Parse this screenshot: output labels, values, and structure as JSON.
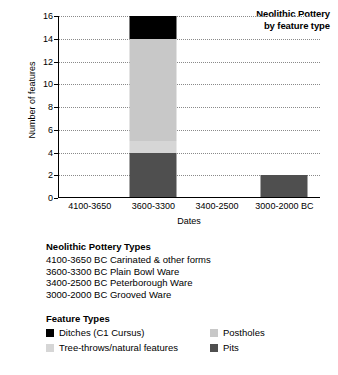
{
  "chart_data": {
    "type": "bar",
    "subtype": "stacked-bar",
    "title": "Neolithic Pottery",
    "subtitle": "by feature type",
    "xlabel": "Dates",
    "ylabel": "Number of features",
    "ylim": [
      0,
      16
    ],
    "ytick_step": 2,
    "yticks": [
      "16",
      "14",
      "12",
      "10",
      "8",
      "6",
      "4",
      "2",
      "0"
    ],
    "grid": true,
    "legend_position": "below-chart",
    "categories": [
      "4100-3650",
      "3600-3300",
      "3400-2500",
      "3000-2000 BC"
    ],
    "series": [
      {
        "name": "Pits",
        "color": "#4f4f4f",
        "values": [
          0,
          4,
          0,
          2
        ]
      },
      {
        "name": "Tree-throws/natural features",
        "color": "#d6d6d6",
        "values": [
          0,
          1,
          0,
          0
        ]
      },
      {
        "name": "Postholes",
        "color": "#c8c8c8",
        "values": [
          0,
          9,
          0,
          0
        ]
      },
      {
        "name": "Ditches (C1 Cursus)",
        "color": "#000000",
        "values": [
          0,
          2,
          0,
          0
        ]
      }
    ],
    "totals": [
      0,
      16,
      0,
      2
    ]
  },
  "notes": {
    "title": "Neolithic Pottery Types",
    "lines": [
      "4100-3650 BC Carinated & other forms",
      "3600-3300 BC Plain Bowl Ware",
      "3400-2500 BC Peterborough Ware",
      "3000-2000 BC Grooved Ware"
    ]
  },
  "legend": {
    "title": "Feature Types",
    "items": [
      {
        "label": "Ditches (C1 Cursus)",
        "color": "#000000"
      },
      {
        "label": "Postholes",
        "color": "#c8c8c8"
      },
      {
        "label": "Tree-throws/natural features",
        "color": "#d6d6d6"
      },
      {
        "label": "Pits",
        "color": "#4f4f4f"
      }
    ]
  }
}
